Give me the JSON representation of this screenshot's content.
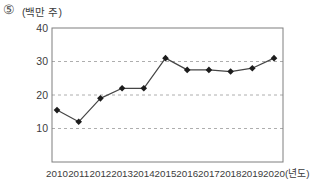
{
  "header": {
    "item_number": "⑤",
    "unit_label": "(백만 주)"
  },
  "colors": {
    "line": "#454545",
    "marker": "#1c1c1c",
    "gridline": "#aeaeae",
    "frame": "#7e7e7e",
    "text": "#3c3c3c",
    "background": "#ffffff"
  },
  "chart_data": {
    "type": "line",
    "x": [
      "2010",
      "2011",
      "2012",
      "2013",
      "2014",
      "2015",
      "2016",
      "2017",
      "2018",
      "2019",
      "2020"
    ],
    "values": [
      15.5,
      12,
      19,
      22,
      22,
      31,
      27.5,
      27.5,
      27,
      28,
      31
    ],
    "title": "",
    "xlabel": "",
    "ylabel": "(백만 주)",
    "x_axis_suffix": "(년도)",
    "ylim": [
      0,
      40
    ],
    "yticks": [
      40,
      30,
      20,
      10
    ],
    "grid": "horizontal-dashed",
    "legend": "none",
    "marker": "diamond",
    "series_count": 1
  }
}
